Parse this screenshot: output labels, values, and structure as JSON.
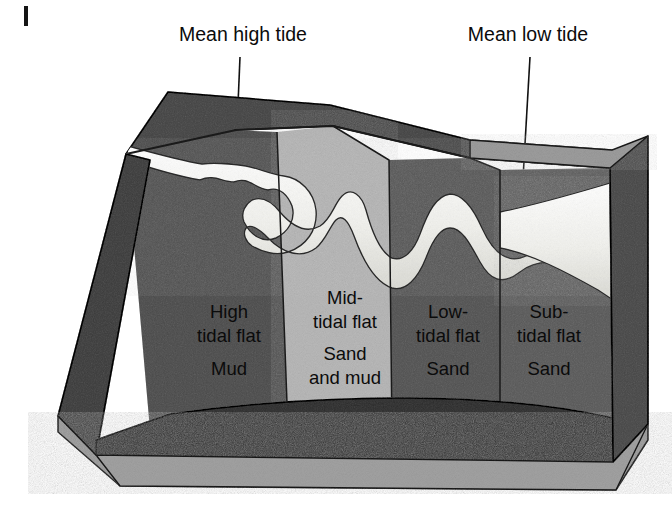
{
  "diagram": {
    "tide_labels": [
      {
        "id": "mean-high-tide",
        "text": "Mean high tide",
        "x": 243,
        "y": 41
      },
      {
        "id": "mean-low-tide",
        "text": "Mean low tide",
        "x": 528,
        "y": 41
      }
    ],
    "zones": [
      {
        "id": "high-tidal-flat",
        "lines": [
          "High",
          "tidal flat",
          "Mud"
        ],
        "sediment": "Mud",
        "fill": "#8e8e8e",
        "label_x": 229,
        "label_y": 318
      },
      {
        "id": "mid-tidal-flat",
        "lines": [
          "Mid-",
          "tidal flat",
          "Sand",
          "and mud"
        ],
        "sediment": "Sand and mud",
        "fill": "#b9b9b9",
        "label_x": 345,
        "label_y": 304
      },
      {
        "id": "low-tidal-flat",
        "lines": [
          "Low-",
          "tidal flat",
          "Sand"
        ],
        "sediment": "Sand",
        "fill": "#949494",
        "label_x": 448,
        "label_y": 318
      },
      {
        "id": "sub-tidal-flat",
        "lines": [
          "Sub-",
          "tidal flat",
          "Sand"
        ],
        "sediment": "Sand",
        "fill": "#9a9a9a",
        "label_x": 547,
        "label_y": 318
      }
    ],
    "channel": {
      "id": "tidal-channel",
      "fill": "#efefec",
      "description": "meandering tidal channel widening seaward"
    },
    "block_faces": {
      "left_face_fill": "#7f7f7f",
      "front_upper_fill": "#6f6f6f",
      "front_lower_fill": "#9b9b9b",
      "right_face_fill": "#8a8a8a",
      "back_scarp_fill": "#878787"
    },
    "outline_color": "#1a1a1a",
    "page_mark": "|"
  }
}
